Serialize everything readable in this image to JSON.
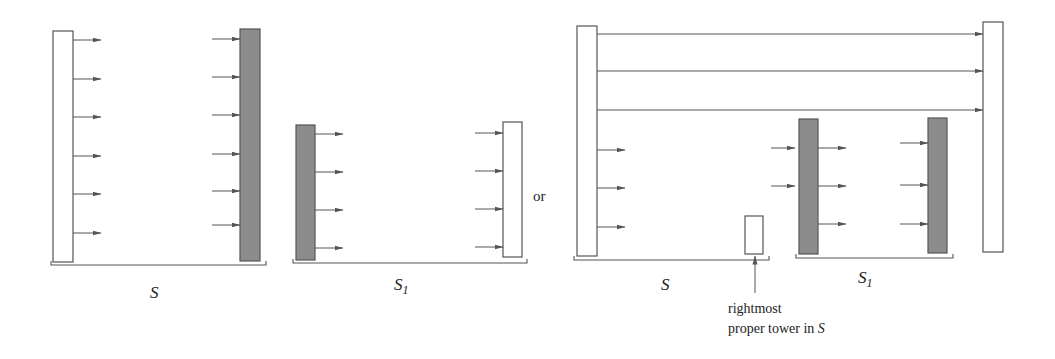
{
  "diagram": {
    "colors": {
      "stroke": "#555555",
      "shaded_fill": "#8c8c8c",
      "open_fill": "#ffffff",
      "arrow": "#555555"
    },
    "left_panel": {
      "group_S": {
        "label": "S",
        "towers": [
          {
            "kind": "open",
            "x": 53,
            "y": 31,
            "w": 20,
            "h": 231
          },
          {
            "kind": "shaded",
            "x": 240,
            "y": 29,
            "w": 20,
            "h": 232
          }
        ],
        "arrows_out": [
          40,
          79,
          117,
          156,
          194,
          233
        ],
        "arrows_in": [
          39,
          77,
          115,
          154,
          191,
          225
        ],
        "bracket": {
          "x1": 51,
          "x2": 266,
          "y": 265
        },
        "label_pos": {
          "x": 155,
          "y": 298
        }
      },
      "group_S1": {
        "label": "S",
        "label_sub": "1",
        "towers": [
          {
            "kind": "shaded",
            "x": 296,
            "y": 125,
            "w": 19,
            "h": 135
          },
          {
            "kind": "open",
            "x": 503,
            "y": 122,
            "w": 19,
            "h": 135
          }
        ],
        "arrows_out": [
          134,
          172,
          210,
          248
        ],
        "arrows_in": [
          133,
          171,
          209,
          247
        ],
        "bracket": {
          "x1": 293,
          "x2": 527,
          "y": 263
        },
        "label_pos": {
          "x": 402,
          "y": 290
        }
      }
    },
    "separator_text": "or",
    "right_panel": {
      "long_arrows_y": [
        34,
        71,
        110
      ],
      "left_tall_tower": {
        "kind": "open",
        "x": 577,
        "y": 26,
        "w": 20,
        "h": 230
      },
      "right_tall_tower": {
        "kind": "open",
        "x": 983,
        "y": 22,
        "w": 20,
        "h": 230
      },
      "group_S": {
        "label": "S",
        "arrows_out": [
          150,
          188,
          227
        ],
        "bracket": {
          "x1": 574,
          "x2": 769,
          "y": 260
        },
        "label_pos": {
          "x": 666,
          "y": 290
        },
        "small_tower": {
          "kind": "open",
          "x": 745,
          "y": 216,
          "w": 18,
          "h": 38
        }
      },
      "group_S1": {
        "label": "S",
        "label_sub": "1",
        "towers": [
          {
            "kind": "shaded",
            "x": 799,
            "y": 119,
            "w": 19,
            "h": 135
          },
          {
            "kind": "shaded",
            "x": 928,
            "y": 118,
            "w": 19,
            "h": 135
          }
        ],
        "arrows_before_first": [
          148,
          186
        ],
        "arrows_out_first": [
          148,
          186,
          224
        ],
        "arrows_in_second": [
          143,
          185,
          224
        ],
        "bracket": {
          "x1": 796,
          "x2": 953,
          "y": 258
        },
        "label_pos": {
          "x": 866,
          "y": 283
        }
      },
      "annotation": {
        "line1": "rightmost",
        "line2_prefix": "proper tower in ",
        "line2_italic": "S",
        "arrow_x": 755,
        "arrow_from_y": 293,
        "arrow_to_y": 256,
        "text_x": 728,
        "line1_y": 313,
        "line2_y": 333
      }
    }
  }
}
